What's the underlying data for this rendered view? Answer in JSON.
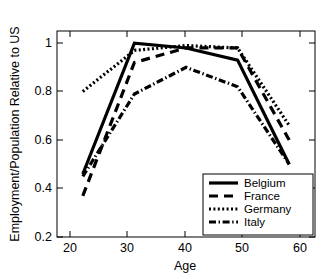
{
  "chart_data": {
    "type": "line",
    "title": "",
    "xlabel": "Age",
    "ylabel": "Employment/Population Relative to US",
    "x": [
      20,
      30,
      40,
      50,
      60
    ],
    "xlim": [
      15,
      65
    ],
    "ylim": [
      0.2,
      1.05
    ],
    "xticks": [
      20,
      30,
      40,
      50,
      60
    ],
    "yticks": [
      0.2,
      0.4,
      0.6,
      0.8,
      1
    ],
    "xticklabels": [
      "20",
      "30",
      "40",
      "50",
      "60"
    ],
    "yticklabels": [
      "0.2",
      "0.4",
      "0.6",
      "0.8",
      "1"
    ],
    "grid": false,
    "legend_position": "lower right",
    "series": [
      {
        "name": "Belgium",
        "style": "solid",
        "values": [
          0.46,
          1.0,
          0.98,
          0.93,
          0.5
        ]
      },
      {
        "name": "France",
        "style": "dashed",
        "values": [
          0.37,
          0.92,
          0.98,
          0.98,
          0.6
        ]
      },
      {
        "name": "Germany",
        "style": "dotted",
        "values": [
          0.8,
          0.97,
          0.99,
          0.98,
          0.66
        ]
      },
      {
        "name": "Italy",
        "style": "dashdot",
        "values": [
          0.45,
          0.79,
          0.9,
          0.82,
          0.5
        ]
      }
    ]
  },
  "legend": {
    "items": [
      {
        "label": "Belgium"
      },
      {
        "label": "France"
      },
      {
        "label": "Germany"
      },
      {
        "label": "Italy"
      }
    ]
  }
}
